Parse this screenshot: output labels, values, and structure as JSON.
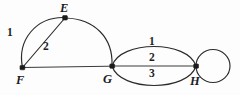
{
  "figure": {
    "type": "multigraph-diagram",
    "width": 240,
    "height": 95,
    "background_color": "#fdfdfd",
    "stroke_color": "#2b2b2b"
  },
  "vertices": [
    {
      "id": "E",
      "label": "E",
      "x": 65,
      "y": 18,
      "label_x": 60,
      "label_y": 2
    },
    {
      "id": "F",
      "label": "F",
      "x": 22,
      "y": 68,
      "label_x": 16,
      "label_y": 74
    },
    {
      "id": "G",
      "label": "G",
      "x": 112,
      "y": 66,
      "label_x": 103,
      "label_y": 73
    },
    {
      "id": "H",
      "label": "H",
      "x": 196,
      "y": 66,
      "label_x": 190,
      "label_y": 75
    }
  ],
  "edges": [
    {
      "from": "F",
      "to": "E",
      "shape": "arc-upper-left",
      "label": "1",
      "label_x": 7,
      "label_y": 27
    },
    {
      "from": "F",
      "to": "E",
      "shape": "straight",
      "label": "2",
      "label_x": 43,
      "label_y": 41
    },
    {
      "from": "E",
      "to": "G",
      "shape": "arc-upper-right",
      "label": ""
    },
    {
      "from": "F",
      "to": "G",
      "shape": "straight",
      "label": ""
    },
    {
      "from": "G",
      "to": "H",
      "shape": "arc-above",
      "label": "1",
      "label_x": 149,
      "label_y": 36
    },
    {
      "from": "G",
      "to": "H",
      "shape": "straight",
      "label": "2",
      "label_x": 149,
      "label_y": 52
    },
    {
      "from": "G",
      "to": "H",
      "shape": "arc-below",
      "label": "3",
      "label_x": 149,
      "label_y": 68
    },
    {
      "from": "H",
      "to": "H",
      "shape": "self-loop-right",
      "label": ""
    }
  ],
  "paths": {
    "f_e_arc": "M 22.5 67.5 C 17 40 36 17 64 17.5",
    "f_e_straight": "M 22.5 67.5 L 64.5 18.5",
    "e_g_arc": "M 65.5 18 C 95 19 113 38 112 65",
    "f_g_straight": "M 23 67.5 L 111.5 66.2",
    "g_h_arc_above": "M 112 66 C 120 40 188 40 196 66",
    "g_h_straight": "M 112.5 66 L 195.5 66",
    "g_h_arc_below": "M 112 66 C 120 92 188 92 196 66",
    "h_self_loop": "M 196.5 66 C 196.5 48 212 44 221 50 C 232 57 230 80 218 84 C 207 88 196.5 80 196.5 66"
  },
  "self_loop": {
    "cx": 213,
    "cy": 66,
    "rx": 17,
    "ry": 16.5
  }
}
